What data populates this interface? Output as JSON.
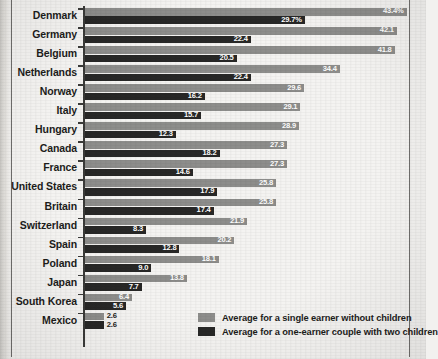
{
  "chart_data": {
    "type": "bar",
    "orientation": "horizontal",
    "title": "",
    "xlabel": "",
    "ylabel": "",
    "grid": false,
    "legend_position": "bottom-right",
    "xlim": [
      0,
      43.4
    ],
    "categories": [
      "Denmark",
      "Germany",
      "Belgium",
      "Netherlands",
      "Norway",
      "Italy",
      "Hungary",
      "Canada",
      "France",
      "United States",
      "Britain",
      "Switzerland",
      "Spain",
      "Poland",
      "Japan",
      "South Korea",
      "Mexico"
    ],
    "series": [
      {
        "name": "Average for a single earner without children",
        "color": "#8d8d8b",
        "values": [
          43.4,
          42.1,
          41.8,
          34.4,
          29.6,
          29.1,
          28.9,
          27.3,
          27.3,
          25.8,
          25.8,
          21.9,
          20.2,
          18.1,
          13.8,
          6.4,
          2.6
        ],
        "labels": [
          "43.4%",
          "42.1",
          "41.8",
          "34.4",
          "29.6",
          "29.1",
          "28.9",
          "27.3",
          "27.3",
          "25.8",
          "25.8",
          "21.9",
          "20.2",
          "18.1",
          "13.8",
          "6.4",
          "2.6"
        ]
      },
      {
        "name": "Average for a one-earner couple with two children",
        "color": "#282827",
        "values": [
          29.7,
          22.4,
          20.5,
          22.4,
          16.2,
          15.7,
          12.3,
          18.2,
          14.6,
          17.9,
          17.4,
          8.3,
          12.8,
          9.0,
          7.7,
          5.6,
          2.6
        ],
        "labels": [
          "29.7%",
          "22.4",
          "20.5",
          "22.4",
          "16.2",
          "15.7",
          "12.3",
          "18.2",
          "14.6",
          "17.9",
          "17.4",
          "8.3",
          "12.8",
          "9.0",
          "7.7",
          "5.6",
          "2.6"
        ]
      }
    ]
  },
  "legend": {
    "items": [
      {
        "label": "Average for a single earner without children",
        "color": "#8d8d8b"
      },
      {
        "label": "Average for a one-earner couple with two children",
        "color": "#282827"
      }
    ]
  },
  "colors": {
    "light_bar": "#8d8d8b",
    "dark_bar": "#282827",
    "axis": "#3a3a38",
    "text": "#1d1d1b",
    "background": "#f4f3f1"
  }
}
